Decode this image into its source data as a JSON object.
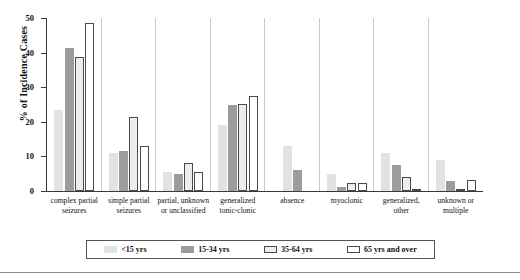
{
  "axis": {
    "ylabel": "% of Incidence Cases",
    "ticks": [
      "0",
      "10",
      "20",
      "30",
      "40",
      "50"
    ]
  },
  "legend": {
    "items": [
      {
        "label": "<15 yrs",
        "swatch": "light-gray-filled-swatch",
        "color": "#e2e2e2"
      },
      {
        "label": "15-34 yrs",
        "swatch": "medium-gray-filled-swatch",
        "color": "#9c9c9c"
      },
      {
        "label": "35-64 yrs",
        "swatch": "outlined-light-swatch",
        "color": "#ededed"
      },
      {
        "label": "65 yrs and over",
        "swatch": "outlined-white-swatch",
        "color": "#ffffff"
      }
    ]
  },
  "chart_data": {
    "type": "bar",
    "title": "",
    "xlabel": "",
    "ylabel": "% of Incidence Cases",
    "ylim": [
      0,
      50
    ],
    "yticks": [
      0,
      10,
      20,
      30,
      40,
      50
    ],
    "grid": false,
    "legend_position": "bottom",
    "categories": [
      "complex partial seizures",
      "simple partial seizures",
      "partial, unknown or unclassified",
      "generalized tonic-clonic",
      "absence",
      "myoclonic",
      "generalized, other",
      "unknown or multiple"
    ],
    "series": [
      {
        "name": "<15 yrs",
        "values": [
          23.3,
          11.0,
          5.5,
          19.0,
          13.0,
          5.0,
          11.0,
          9.0
        ]
      },
      {
        "name": "15-34 yrs",
        "values": [
          41.3,
          11.5,
          5.0,
          25.0,
          6.0,
          1.2,
          7.5,
          3.0
        ]
      },
      {
        "name": "35-64 yrs",
        "values": [
          38.7,
          21.5,
          8.0,
          25.2,
          0.0,
          2.2,
          4.0,
          0.3
        ]
      },
      {
        "name": "65 yrs and over",
        "values": [
          48.7,
          13.0,
          5.5,
          27.5,
          0.0,
          2.2,
          0.2,
          3.2
        ]
      }
    ]
  }
}
